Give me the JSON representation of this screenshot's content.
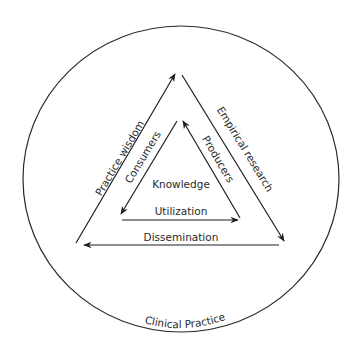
{
  "diagram": {
    "outer_circle": {
      "label": "Clinical Practice"
    },
    "center": {
      "label": "Knowledge"
    },
    "outer_triangle": {
      "left_edge": {
        "label": "Practice wisdom",
        "direction": "up-to-apex"
      },
      "right_edge": {
        "label": "Empirical research",
        "direction": "down-from-apex"
      },
      "bottom_edge": {
        "label": "Dissemination",
        "direction": "right-to-left"
      }
    },
    "inner_triangle": {
      "left_edge": {
        "label": "Consumers",
        "direction": "down-from-apex"
      },
      "right_edge": {
        "label": "Producers",
        "direction": "up-to-apex"
      },
      "bottom_edge": {
        "label": "Utilization",
        "direction": "left-to-right"
      }
    },
    "colors": {
      "stroke": "#1e1e1e",
      "text": "#2a2a2a",
      "background": "#ffffff"
    }
  }
}
